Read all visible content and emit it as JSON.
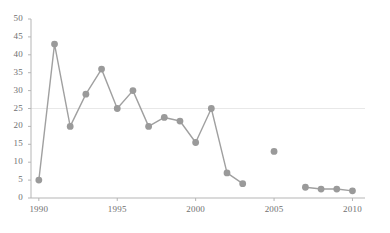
{
  "chart_data": {
    "type": "line",
    "title": "",
    "subtitle": "",
    "xlabel": "",
    "ylabel": "",
    "xlim": [
      1989.5,
      2010.8
    ],
    "ylim": [
      0,
      50
    ],
    "ytick_step": 5,
    "xtick_step": 5,
    "grid": "faint horizontal gridline at y=25 only",
    "legend": "none",
    "marker": "filled circle",
    "series": [
      {
        "name": "segment-1",
        "connected": true,
        "x": [
          1990,
          1991,
          1992,
          1993,
          1994,
          1995,
          1996,
          1997,
          1998,
          1999,
          2000,
          2001,
          2002,
          2003
        ],
        "values": [
          5,
          43,
          20,
          29,
          36,
          25,
          30,
          20,
          22.5,
          21.5,
          15.5,
          25,
          7,
          4
        ]
      },
      {
        "name": "isolated-point-2005",
        "connected": false,
        "x": [
          2005
        ],
        "values": [
          13
        ]
      },
      {
        "name": "segment-2",
        "connected": true,
        "x": [
          2007,
          2008,
          2009,
          2010
        ],
        "values": [
          3,
          2.5,
          2.5,
          2
        ]
      }
    ],
    "yticks": [
      0,
      5,
      10,
      15,
      20,
      25,
      30,
      35,
      40,
      45,
      50
    ],
    "ytick_labels": [
      "0",
      "5",
      "10",
      "15",
      "20",
      "25",
      "30",
      "35",
      "40",
      "45",
      "50"
    ],
    "xticks": [
      1990,
      1995,
      2000,
      2005,
      2010
    ],
    "xtick_labels": [
      "1990",
      "1995",
      "2000",
      "2005",
      "2010"
    ],
    "colors": {
      "line": "#a0a0a0",
      "marker": "#9a9a9a",
      "axis": "#b5b5b5",
      "grid": "#e8e8e8",
      "tick_text": "#6f6f6f",
      "background": "#ffffff"
    },
    "geometry": {
      "plot_left": 31,
      "plot_right": 365,
      "plot_top": 19,
      "plot_bottom": 198,
      "marker_radius": 3.4,
      "line_width": 1.4
    }
  }
}
